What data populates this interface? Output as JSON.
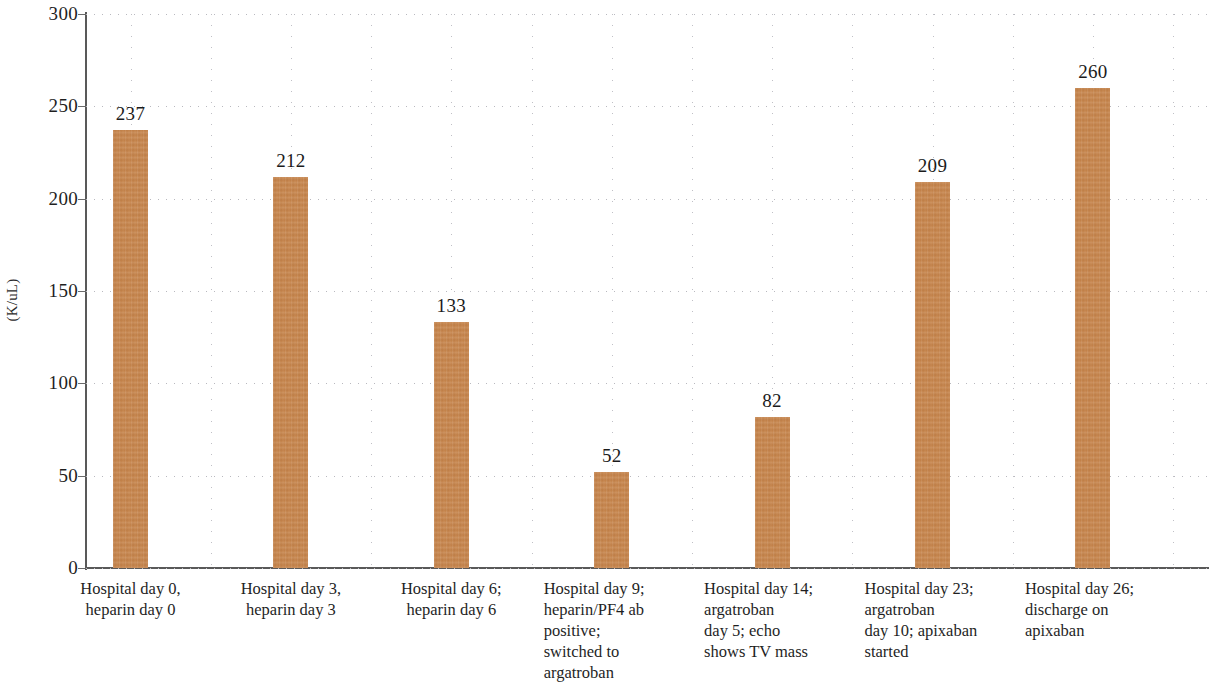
{
  "chart_data": {
    "type": "bar",
    "title": "",
    "xlabel": "",
    "ylabel": "(K/uL)",
    "ylim": [
      0,
      300
    ],
    "ytick_step": 50,
    "yticks": [
      "0",
      "50",
      "100",
      "150",
      "200",
      "250",
      "300"
    ],
    "grid": "both-dotted",
    "legend": "none",
    "bar_color": "#c5834a",
    "categories": [
      "Hospital day 0, heparin day 0",
      "Hospital day 3, heparin day 3",
      "Hospital day 6; heparin day 6",
      "Hospital day 9; heparin/PF4 ab positive; switched to argatroban",
      "Hospital day 14; argatroban day 5; echo shows TV mass",
      "Hospital day 23; argatroban day 10; apixaban started",
      "Hospital day 26; discharge on apixaban"
    ],
    "values": [
      237,
      212,
      133,
      52,
      82,
      209,
      260
    ],
    "value_labels": [
      "237",
      "212",
      "133",
      "52",
      "82",
      "209",
      "260"
    ]
  },
  "category_lines": [
    [
      "Hospital day 0,",
      "heparin day 0"
    ],
    [
      "Hospital day 3,",
      "heparin day 3"
    ],
    [
      "Hospital day 6;",
      "heparin day 6"
    ],
    [
      "Hospital day 9;",
      "heparin/PF4 ab",
      "positive;",
      "switched to",
      "argatroban"
    ],
    [
      "Hospital day 14;",
      "argatroban",
      "day 5; echo",
      "shows TV mass"
    ],
    [
      "Hospital day 23;",
      "argatroban",
      "day 10; apixaban",
      "started"
    ],
    [
      "Hospital day 26;",
      "discharge on",
      "apixaban"
    ]
  ]
}
